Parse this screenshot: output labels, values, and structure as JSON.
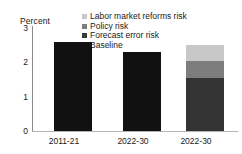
{
  "chart_data": {
    "type": "bar",
    "title": "",
    "subtitle": "",
    "ylabel": "Percent",
    "xlabel": "",
    "ylim": [
      0,
      3
    ],
    "yticks": [
      "0",
      "1",
      "2",
      "3"
    ],
    "ytick_values": [
      0,
      1,
      2,
      3
    ],
    "grid": false,
    "legend_position": "top-center",
    "categories": [
      "2011-21",
      "2022-30",
      "2022-30"
    ],
    "series": [
      {
        "name": "Baseline",
        "color": "#111111",
        "values": [
          2.6,
          2.3,
          1.55
        ]
      },
      {
        "name": "Forecast error risk",
        "color": "#3a3a3a",
        "values": [
          0,
          0,
          0.0
        ]
      },
      {
        "name": "Policy risk",
        "color": "#7d7d7d",
        "values": [
          0,
          0,
          0.5
        ]
      },
      {
        "name": "Labor market reforms risk",
        "color": "#c8c8c8",
        "values": [
          0,
          0,
          0.45
        ]
      }
    ],
    "bars": [
      {
        "category": "2011-21",
        "stacked": false,
        "total": 2.6,
        "segments": [
          {
            "name": "Baseline",
            "value": 2.6,
            "color": "#111111"
          }
        ]
      },
      {
        "category": "2022-30",
        "stacked": false,
        "total": 2.3,
        "segments": [
          {
            "name": "Baseline",
            "value": 2.3,
            "color": "#111111"
          }
        ]
      },
      {
        "category": "2022-30",
        "stacked": true,
        "total": 2.5,
        "segments": [
          {
            "name": "Baseline",
            "value": 1.55,
            "color": "#333333"
          },
          {
            "name": "Policy risk",
            "value": 0.5,
            "color": "#7d7d7d"
          },
          {
            "name": "Labor market reforms risk",
            "value": 0.45,
            "color": "#c8c8c8"
          }
        ]
      }
    ]
  },
  "legend": {
    "items": [
      {
        "label": "Labor market reforms risk",
        "color": "#c8c8c8"
      },
      {
        "label": "Policy risk",
        "color": "#7d7d7d"
      },
      {
        "label": "Forecast error risk",
        "color": "#3a3a3a"
      },
      {
        "label": "Baseline",
        "color": "#111111"
      }
    ]
  },
  "axes": {
    "y_title": "Percent",
    "y_ticks": [
      "3",
      "2",
      "1",
      "0"
    ],
    "x_ticks": [
      "2011-21",
      "2022-30",
      "2022-30"
    ]
  }
}
